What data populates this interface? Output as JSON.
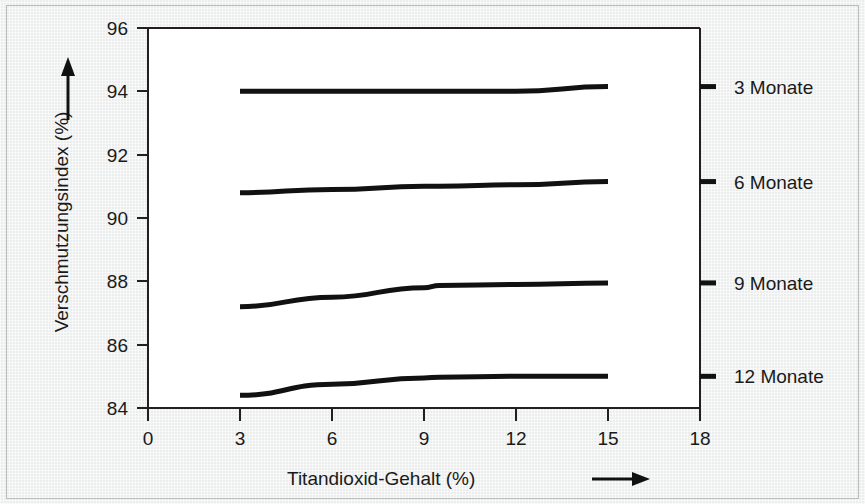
{
  "chart_data": {
    "type": "line",
    "title": "",
    "subtitle": "",
    "xlabel": "Titandioxid-Gehalt (%)",
    "ylabel": "Verschmutzungsindex (%)",
    "xlim": [
      0,
      18
    ],
    "ylim": [
      84,
      96
    ],
    "xticks": [
      0,
      3,
      6,
      9,
      12,
      15,
      18
    ],
    "xtick_labels": [
      "0",
      "3",
      "6",
      "9",
      "12",
      "15",
      "18"
    ],
    "yticks": [
      84,
      86,
      88,
      90,
      92,
      94,
      96
    ],
    "ytick_labels": [
      "84",
      "86",
      "88",
      "90",
      "92",
      "94",
      "96"
    ],
    "grid": false,
    "legend_position": "right-inline",
    "x": [
      3,
      6,
      9,
      9.5,
      12,
      15
    ],
    "series": [
      {
        "name": "3 Monate",
        "label": "3 Monate",
        "color": "#111111",
        "values": [
          94.0,
          94.0,
          94.0,
          94.0,
          94.0,
          94.15
        ]
      },
      {
        "name": "6 Monate",
        "label": "6 Monate",
        "color": "#111111",
        "values": [
          90.8,
          90.9,
          91.0,
          91.0,
          91.05,
          91.15
        ]
      },
      {
        "name": "9 Monate",
        "label": "9 Monate",
        "color": "#111111",
        "values": [
          87.2,
          87.5,
          87.8,
          87.87,
          87.9,
          87.95
        ]
      },
      {
        "name": "12 Monate",
        "label": "12 Monate",
        "color": "#111111",
        "values": [
          84.4,
          84.75,
          84.95,
          84.97,
          85.0,
          85.0
        ]
      }
    ],
    "xaxis_arrow": true,
    "yaxis_arrow": true
  },
  "axes": {
    "x_title": "Titandioxid-Gehalt (%)",
    "y_title": "Verschmutzungsindex (%)"
  },
  "legend": {
    "items": [
      {
        "label": "3 Monate"
      },
      {
        "label": "6 Monate"
      },
      {
        "label": "9 Monate"
      },
      {
        "label": "12 Monate"
      }
    ]
  },
  "ticks": {
    "x": [
      "0",
      "3",
      "6",
      "9",
      "12",
      "15",
      "18"
    ],
    "y": [
      "84",
      "86",
      "88",
      "90",
      "92",
      "94",
      "96"
    ]
  }
}
